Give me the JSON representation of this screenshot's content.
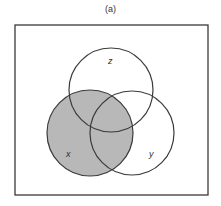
{
  "caption": "(a)",
  "colors": {
    "stroke": "#3a3a3a",
    "shade": "#b8b8b8",
    "background": "#ffffff"
  },
  "diagram": {
    "type": "venn",
    "universe": {
      "x": 15,
      "y": 25,
      "width": 193,
      "height": 170
    },
    "sets": [
      {
        "name": "z",
        "label": "z",
        "cx": 111,
        "cy": 90,
        "r": 42,
        "shaded": false,
        "label_x": 108,
        "label_y": 64
      },
      {
        "name": "x",
        "label": "x",
        "cx": 90,
        "cy": 133,
        "r": 43,
        "shaded": true,
        "label_x": 68,
        "label_y": 156
      },
      {
        "name": "y",
        "label": "y",
        "cx": 132,
        "cy": 133,
        "r": 42,
        "shaded": false,
        "label_x": 150,
        "label_y": 156
      }
    ],
    "shaded_region": "x"
  }
}
